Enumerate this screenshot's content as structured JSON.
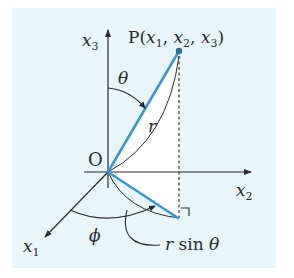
{
  "diagram": {
    "colors": {
      "panel": "#e8f6fb",
      "plane": "#ffffff",
      "ink": "#2a2a2a",
      "vector": "#3a96d6"
    },
    "axes": {
      "x1": {
        "name": "x",
        "sub": "1"
      },
      "x2": {
        "name": "x",
        "sub": "2"
      },
      "x3": {
        "name": "x",
        "sub": "3"
      }
    },
    "origin_label": "O",
    "point": {
      "prefix": "P(",
      "c1": "x",
      "s1": "1",
      "sep1": ", ",
      "c2": "x",
      "s2": "2",
      "sep2": ", ",
      "c3": "x",
      "s3": "3",
      "suffix": ")"
    },
    "angles": {
      "theta": "θ",
      "phi": "ϕ"
    },
    "lengths": {
      "r": "r",
      "r_sin_theta_r": "r",
      "r_sin_theta_sin": " sin ",
      "r_sin_theta_theta": "θ"
    }
  }
}
